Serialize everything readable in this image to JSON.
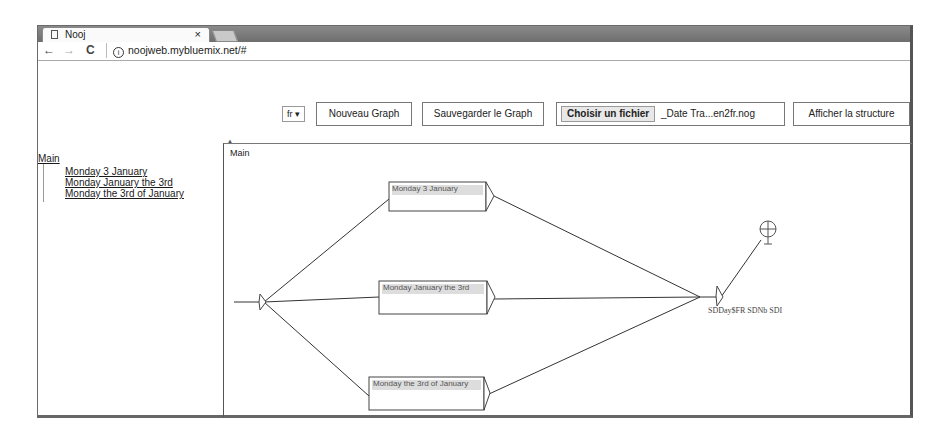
{
  "browser": {
    "tab_title": "Nooj",
    "tab_close": "×",
    "url": "noojweb.mybluemix.net/#",
    "nav": {
      "back": "←",
      "forward": "→",
      "reload": "C"
    }
  },
  "toolbar": {
    "language_select": "fr",
    "new_graph": "Nouveau Graph",
    "save_graph": "Sauvegarder le Graph",
    "choose_file": "Choisir un fichier",
    "file_name": "_Date Tra...en2fr.nog",
    "show_structure": "Afficher la structure"
  },
  "sidebar": {
    "root": "Main",
    "items": [
      {
        "label": "Monday 3 January"
      },
      {
        "label": "Monday January the 3rd"
      },
      {
        "label": "Monday the 3rd of January"
      }
    ]
  },
  "graph": {
    "title": "Main",
    "nodes": [
      {
        "label": "Monday 3 January"
      },
      {
        "label": "Monday January the 3rd"
      },
      {
        "label": "Monday the 3rd of January"
      }
    ],
    "output_label": "SDDay$FR SDNb SDI"
  }
}
